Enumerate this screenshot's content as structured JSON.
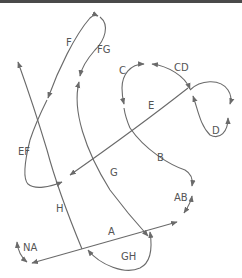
{
  "diagram": {
    "type": "knot-path-diagram",
    "stroke_color": "#6a6a6a",
    "label_color": "#555555",
    "labels": {
      "A": "A",
      "AB": "AB",
      "B": "B",
      "C": "C",
      "CD": "CD",
      "D": "D",
      "E": "E",
      "EF": "EF",
      "F": "F",
      "FG": "FG",
      "G": "G",
      "GH": "GH",
      "H": "H",
      "NA": "NA"
    }
  }
}
